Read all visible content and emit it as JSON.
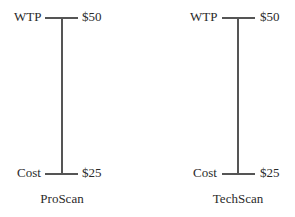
{
  "diagrams": [
    {
      "product": "ProScan",
      "top": {
        "label": "WTP",
        "value": "$50"
      },
      "bottom": {
        "label": "Cost",
        "value": "$25"
      }
    },
    {
      "product": "TechScan",
      "top": {
        "label": "WTP",
        "value": "$50"
      },
      "bottom": {
        "label": "Cost",
        "value": "$25"
      }
    }
  ]
}
